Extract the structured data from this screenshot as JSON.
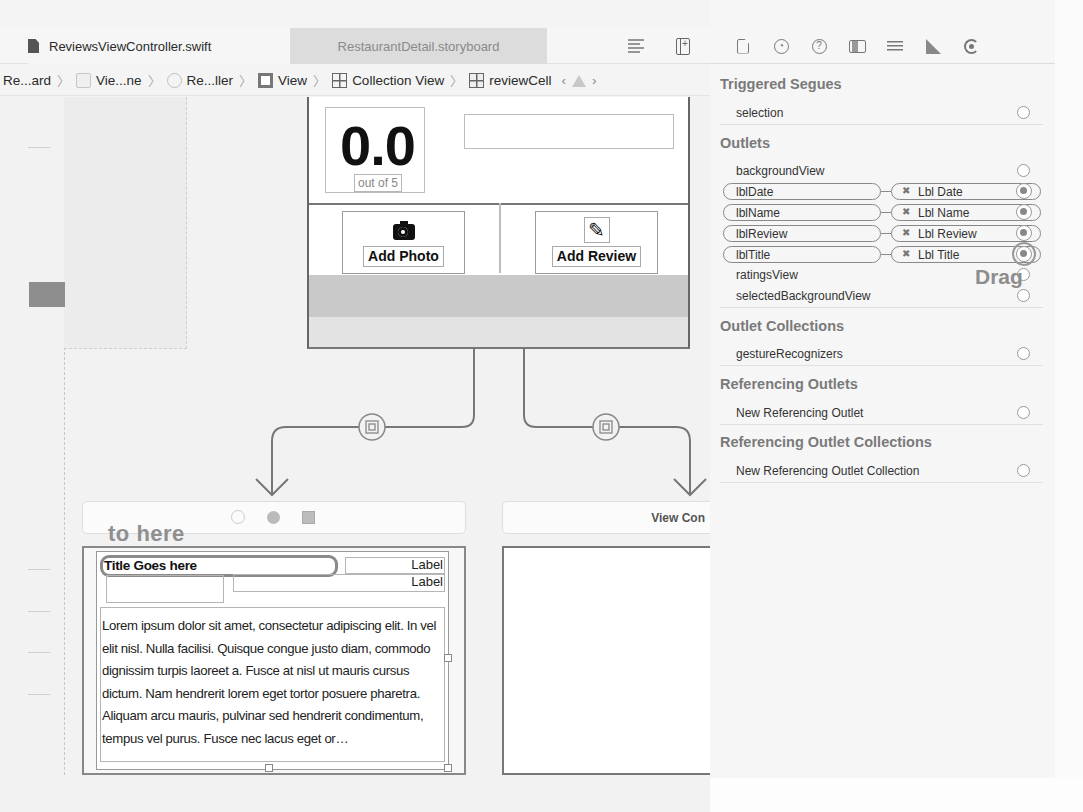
{
  "tabs": {
    "active": {
      "label": "ReviewsViewController.swift",
      "icon": "swift-file-icon"
    },
    "inactive": {
      "label": "RestaurantDetail.storyboard"
    }
  },
  "toolbar": {
    "editor_options_icon": "lines-icon",
    "add_editor_icon": "split-add-icon"
  },
  "breadcrumb": [
    {
      "label": "Re...ard",
      "icon": null
    },
    {
      "label": "Vie...ne",
      "icon": "scene-icon"
    },
    {
      "label": "Re...ller",
      "icon": "view-controller-icon"
    },
    {
      "label": "View",
      "icon": "view-icon"
    },
    {
      "label": "Collection View",
      "icon": "collection-view-icon"
    },
    {
      "label": "reviewCell",
      "icon": "collection-cell-icon"
    }
  ],
  "breadcrumb_nav": {
    "prev": "‹",
    "next": "›",
    "warning_icon": "warning-icon"
  },
  "canvas": {
    "rating": {
      "value": "0.0",
      "caption": "out of 5"
    },
    "buttons": {
      "add_photo": {
        "label": "Add Photo",
        "icon": "camera-icon"
      },
      "add_review": {
        "label": "Add Review",
        "icon": "pencil-icon"
      }
    },
    "annotation_to_here": "to here",
    "right_scene_title": "View Con",
    "cell": {
      "title_label": "Title Goes here",
      "label_1": "Label",
      "label_2": "Label",
      "review_text": "Lorem ipsum dolor sit amet, consectetur adipiscing elit. In vel elit nisl. Nulla facilisi. Quisque congue justo diam, commodo dignissim turpis laoreet a. Fusce at nisl ut mauris cursus dictum. Nam hendrerit lorem eget tortor posuere pharetra. Aliquam arcu mauris, pulvinar sed hendrerit condimentum, tempus vel purus. Fusce nec lacus eget or…"
    }
  },
  "inspector": {
    "toolbar_icons": [
      "file-inspector-icon",
      "history-icon",
      "quick-help-icon",
      "identity-inspector-icon",
      "attributes-inspector-icon",
      "size-inspector-icon",
      "connections-inspector-icon"
    ],
    "sections": {
      "triggered_segues": {
        "title": "Triggered Segues",
        "items": [
          {
            "name": "selection"
          }
        ]
      },
      "outlets": {
        "title": "Outlets",
        "items": [
          {
            "name": "backgroundView",
            "connected": false
          },
          {
            "name": "lblDate",
            "connected": true,
            "target": "Lbl Date"
          },
          {
            "name": "lblName",
            "connected": true,
            "target": "Lbl Name"
          },
          {
            "name": "lblReview",
            "connected": true,
            "target": "Lbl Review"
          },
          {
            "name": "lblTitle",
            "connected": true,
            "target": "Lbl Title"
          },
          {
            "name": "ratingsView",
            "connected": false
          },
          {
            "name": "selectedBackgroundView",
            "connected": false
          }
        ]
      },
      "outlet_collections": {
        "title": "Outlet Collections",
        "items": [
          {
            "name": "gestureRecognizers"
          }
        ]
      },
      "referencing_outlets": {
        "title": "Referencing Outlets",
        "items": [
          {
            "name": "New Referencing Outlet"
          }
        ]
      },
      "referencing_outlet_collections": {
        "title": "Referencing Outlet Collections",
        "items": [
          {
            "name": "New Referencing Outlet Collection"
          }
        ]
      }
    },
    "annotation_drag": "Drag",
    "remove_glyph": "✖"
  }
}
